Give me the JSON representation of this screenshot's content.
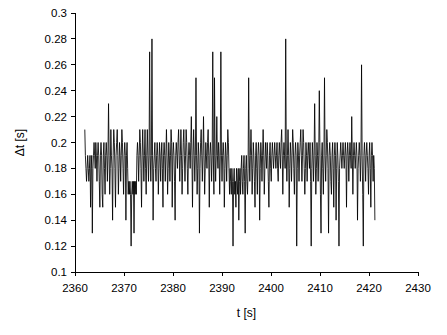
{
  "chart_data": {
    "type": "line",
    "title": "",
    "subtitle": "",
    "xlabel": "t [s]",
    "ylabel": "Δt [s]",
    "xlim": [
      2360,
      2430
    ],
    "ylim": [
      0.1,
      0.3
    ],
    "xticks": [
      2360,
      2370,
      2380,
      2390,
      2400,
      2410,
      2420,
      2430
    ],
    "yticks": [
      0.1,
      0.12,
      0.14,
      0.16,
      0.18,
      0.2,
      0.22,
      0.24,
      0.26,
      0.28,
      0.3
    ],
    "xtick_labels": [
      "2360",
      "2370",
      "2380",
      "2390",
      "2400",
      "2410",
      "2420",
      "2430"
    ],
    "ytick_labels": [
      "0.1",
      "0.12",
      "0.14",
      "0.16",
      "0.18",
      "0.2",
      "0.22",
      "0.24",
      "0.26",
      "0.28",
      "0.3"
    ],
    "grid": false,
    "legend": false,
    "legend_position": "none",
    "line_color": "#000000",
    "background_color": "#ffffff",
    "series": [
      {
        "name": "Δt",
        "x_start": 2362.0,
        "x_end": 2421.2,
        "x_step": 0.2,
        "values": [
          0.21,
          0.19,
          0.18,
          0.17,
          0.18,
          0.19,
          0.18,
          0.17,
          0.18,
          0.19,
          0.15,
          0.18,
          0.19,
          0.13,
          0.18,
          0.19,
          0.2,
          0.19,
          0.18,
          0.2,
          0.19,
          0.17,
          0.19,
          0.2,
          0.19,
          0.17,
          0.15,
          0.19,
          0.2,
          0.19,
          0.16,
          0.15,
          0.19,
          0.2,
          0.18,
          0.16,
          0.19,
          0.2,
          0.19,
          0.17,
          0.19,
          0.23,
          0.19,
          0.16,
          0.18,
          0.21,
          0.19,
          0.18,
          0.14,
          0.19,
          0.21,
          0.2,
          0.18,
          0.15,
          0.19,
          0.2,
          0.21,
          0.19,
          0.16,
          0.18,
          0.2,
          0.19,
          0.17,
          0.19,
          0.21,
          0.2,
          0.18,
          0.16,
          0.19,
          0.2,
          0.19,
          0.14,
          0.19,
          0.2,
          0.18,
          0.16,
          0.17,
          0.16,
          0.17,
          0.16,
          0.12,
          0.16,
          0.17,
          0.16,
          0.17,
          0.13,
          0.17,
          0.16,
          0.17,
          0.16,
          0.19,
          0.2,
          0.19,
          0.17,
          0.19,
          0.21,
          0.2,
          0.18,
          0.15,
          0.19,
          0.21,
          0.19,
          0.17,
          0.19,
          0.21,
          0.18,
          0.16,
          0.19,
          0.21,
          0.19,
          0.17,
          0.19,
          0.27,
          0.19,
          0.17,
          0.19,
          0.28,
          0.19,
          0.14,
          0.18,
          0.19,
          0.2,
          0.18,
          0.17,
          0.19,
          0.2,
          0.19,
          0.16,
          0.18,
          0.2,
          0.19,
          0.17,
          0.19,
          0.2,
          0.18,
          0.15,
          0.19,
          0.2,
          0.19,
          0.17,
          0.19,
          0.21,
          0.19,
          0.16,
          0.18,
          0.2,
          0.19,
          0.17,
          0.19,
          0.21,
          0.2,
          0.15,
          0.19,
          0.2,
          0.19,
          0.17,
          0.14,
          0.19,
          0.2,
          0.19,
          0.18,
          0.2,
          0.21,
          0.19,
          0.17,
          0.19,
          0.21,
          0.19,
          0.16,
          0.18,
          0.2,
          0.21,
          0.19,
          0.17,
          0.19,
          0.21,
          0.2,
          0.18,
          0.16,
          0.19,
          0.2,
          0.19,
          0.18,
          0.2,
          0.22,
          0.19,
          0.15,
          0.19,
          0.21,
          0.19,
          0.17,
          0.19,
          0.25,
          0.19,
          0.16,
          0.18,
          0.2,
          0.19,
          0.13,
          0.18,
          0.2,
          0.21,
          0.19,
          0.17,
          0.19,
          0.22,
          0.19,
          0.16,
          0.18,
          0.2,
          0.19,
          0.18,
          0.2,
          0.21,
          0.19,
          0.15,
          0.19,
          0.2,
          0.19,
          0.17,
          0.19,
          0.27,
          0.19,
          0.16,
          0.25,
          0.19,
          0.17,
          0.19,
          0.22,
          0.19,
          0.18,
          0.2,
          0.19,
          0.16,
          0.19,
          0.27,
          0.19,
          0.17,
          0.19,
          0.2,
          0.19,
          0.15,
          0.18,
          0.2,
          0.19,
          0.17,
          0.19,
          0.21,
          0.2,
          0.18,
          0.16,
          0.18,
          0.17,
          0.16,
          0.18,
          0.17,
          0.12,
          0.17,
          0.18,
          0.16,
          0.17,
          0.15,
          0.18,
          0.17,
          0.16,
          0.18,
          0.14,
          0.17,
          0.18,
          0.16,
          0.18,
          0.19,
          0.17,
          0.16,
          0.18,
          0.19,
          0.17,
          0.13,
          0.18,
          0.19,
          0.17,
          0.16,
          0.18,
          0.25,
          0.19,
          0.17,
          0.19,
          0.21,
          0.19,
          0.16,
          0.18,
          0.2,
          0.19,
          0.17,
          0.15,
          0.19,
          0.2,
          0.18,
          0.16,
          0.19,
          0.2,
          0.19,
          0.14,
          0.18,
          0.2,
          0.19,
          0.17,
          0.19,
          0.21,
          0.19,
          0.16,
          0.18,
          0.2,
          0.19,
          0.18,
          0.2,
          0.19,
          0.17,
          0.15,
          0.19,
          0.2,
          0.18,
          0.17,
          0.19,
          0.2,
          0.19,
          0.18,
          0.19,
          0.2,
          0.19,
          0.18,
          0.19,
          0.2,
          0.18,
          0.17,
          0.19,
          0.2,
          0.19,
          0.18,
          0.2,
          0.21,
          0.19,
          0.16,
          0.19,
          0.2,
          0.19,
          0.18,
          0.28,
          0.19,
          0.17,
          0.19,
          0.21,
          0.19,
          0.15,
          0.18,
          0.2,
          0.19,
          0.17,
          0.19,
          0.21,
          0.2,
          0.18,
          0.16,
          0.19,
          0.2,
          0.19,
          0.12,
          0.18,
          0.2,
          0.19,
          0.17,
          0.19,
          0.2,
          0.21,
          0.19,
          0.17,
          0.19,
          0.21,
          0.2,
          0.18,
          0.16,
          0.18,
          0.2,
          0.19,
          0.17,
          0.19,
          0.2,
          0.19,
          0.18,
          0.2,
          0.17,
          0.12,
          0.18,
          0.2,
          0.19,
          0.17,
          0.19,
          0.23,
          0.19,
          0.16,
          0.18,
          0.2,
          0.19,
          0.17,
          0.19,
          0.24,
          0.2,
          0.16,
          0.13,
          0.19,
          0.2,
          0.18,
          0.16,
          0.19,
          0.25,
          0.19,
          0.17,
          0.19,
          0.21,
          0.2,
          0.18,
          0.13,
          0.19,
          0.2,
          0.19,
          0.17,
          0.16,
          0.19,
          0.2,
          0.18,
          0.15,
          0.19,
          0.2,
          0.19,
          0.14,
          0.18,
          0.2,
          0.19,
          0.17,
          0.12,
          0.18,
          0.19,
          0.2,
          0.19,
          0.18,
          0.19,
          0.2,
          0.19,
          0.18,
          0.19,
          0.2,
          0.19,
          0.15,
          0.19,
          0.2,
          0.19,
          0.17,
          0.19,
          0.2,
          0.19,
          0.18,
          0.22,
          0.19,
          0.16,
          0.19,
          0.2,
          0.19,
          0.18,
          0.19,
          0.2,
          0.19,
          0.14,
          0.18,
          0.19,
          0.2,
          0.19,
          0.17,
          0.19,
          0.26,
          0.19,
          0.16,
          0.12,
          0.19,
          0.2,
          0.19,
          0.17,
          0.19,
          0.2,
          0.19,
          0.18,
          0.16,
          0.19,
          0.2,
          0.18,
          0.15,
          0.19,
          0.2,
          0.19,
          0.17,
          0.19,
          0.18,
          0.14
        ]
      }
    ]
  }
}
